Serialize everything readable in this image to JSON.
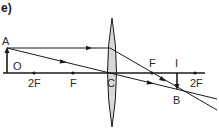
{
  "diagram": {
    "title": "e)",
    "type": "convex lens ray diagram",
    "labels": {
      "object_top": "A",
      "object": "O",
      "left_2f": "2F",
      "left_f": "F",
      "optical_center": "C",
      "right_f": "F",
      "image": "I",
      "right_2f": "2F",
      "image_tip": "B"
    },
    "colors": {
      "line": "#1a1a1a",
      "lens_fill": "#d8d8d8",
      "background": "#ffffff"
    }
  }
}
